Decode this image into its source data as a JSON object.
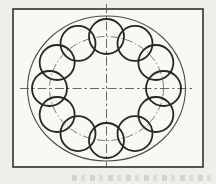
{
  "page": {
    "background": "#efeeea",
    "frame_fill": "#f9f8f4"
  },
  "drawing": {
    "canvas": {
      "width": 216,
      "height": 184
    },
    "frame": {
      "x": 13,
      "y": 9,
      "width": 190,
      "height": 158,
      "stroke": "#3b3b3b",
      "stroke_width": 1.7
    },
    "center": {
      "x": 106.5,
      "y": 88.5
    },
    "outer_circle": {
      "rx": 79,
      "ry": 72.5,
      "stroke": "#4c4c4c",
      "stroke_width": 1.1
    },
    "pitch_circle": {
      "rx": 57,
      "ry": 52,
      "stroke": "#5c5c5c",
      "stroke_width": 0.8,
      "dash": "8 2.5 1.5 2.5"
    },
    "small_circles": {
      "count": 12,
      "radius": 17.5,
      "start_angle_deg": 90,
      "step_deg": 30,
      "stroke": "#272727",
      "stroke_width": 1.8
    },
    "centerlines": {
      "stroke": "#565656",
      "stroke_width": 0.9,
      "dash": "9 3 2.5 3",
      "horizontal": {
        "x1": 20,
        "x2": 194,
        "y": 88.5
      },
      "vertical": {
        "x": 106.5,
        "y1": 4,
        "y2": 166
      }
    }
  },
  "caption_remnant": {
    "visible": true,
    "color": "#6e6c64"
  }
}
